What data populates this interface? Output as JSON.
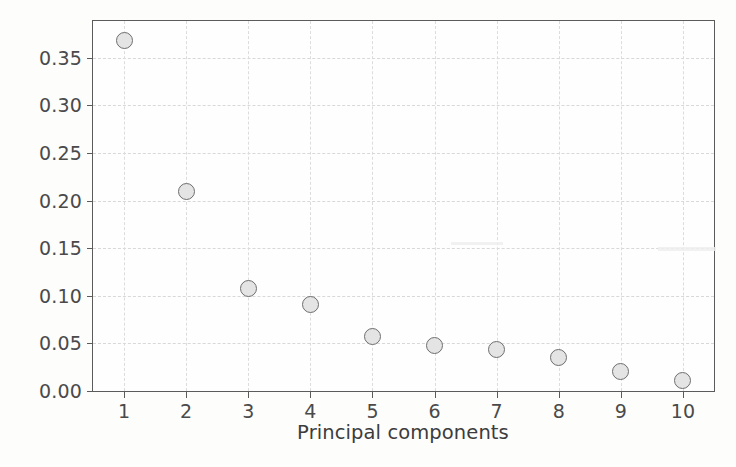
{
  "chart_data": {
    "type": "scatter",
    "title": "",
    "xlabel": "Principal components",
    "ylabel": "Explainec variance ratio",
    "categories": [
      "1",
      "2",
      "3",
      "4",
      "5",
      "6",
      "7",
      "8",
      "9",
      "10"
    ],
    "x": [
      1,
      2,
      3,
      4,
      5,
      6,
      7,
      8,
      9,
      10
    ],
    "values": [
      0.368,
      0.21,
      0.108,
      0.091,
      0.057,
      0.048,
      0.044,
      0.035,
      0.021,
      0.011
    ],
    "series": [
      {
        "name": "Explained variance ratio",
        "values": [
          0.368,
          0.21,
          0.108,
          0.091,
          0.057,
          0.048,
          0.044,
          0.035,
          0.021,
          0.011
        ]
      }
    ],
    "xlim": [
      0.5,
      10.5
    ],
    "ylim": [
      0.0,
      0.3885
    ],
    "xticks": [
      "1",
      "2",
      "3",
      "4",
      "5",
      "6",
      "7",
      "8",
      "9",
      "10"
    ],
    "yticks": [
      "0.00",
      "0.05",
      "0.10",
      "0.15",
      "0.20",
      "0.25",
      "0.30",
      "0.35"
    ],
    "ytick_values": [
      0.0,
      0.05,
      0.1,
      0.15,
      0.2,
      0.25,
      0.3,
      0.35
    ],
    "grid": true,
    "legend": false,
    "legend_position": "none",
    "marker": "circle",
    "marker_face_color": "#e4e4e4",
    "marker_edge_color": "#6e6e6e",
    "gridline_color": "#d8d8d8",
    "axis_color": "#5b5b5b",
    "background_color": "#fdfdfc"
  },
  "axes": {
    "y_title": "Explainec variance ratio",
    "x_title": "Principal components",
    "y_tick_labels": [
      "0.35",
      "0.30",
      "0.25",
      "0.20",
      "0.15",
      "0.10",
      "0.05",
      "0.00"
    ],
    "x_tick_labels": [
      "1",
      "2",
      "3",
      "4",
      "5",
      "6",
      "7",
      "8",
      "9",
      "10"
    ]
  }
}
